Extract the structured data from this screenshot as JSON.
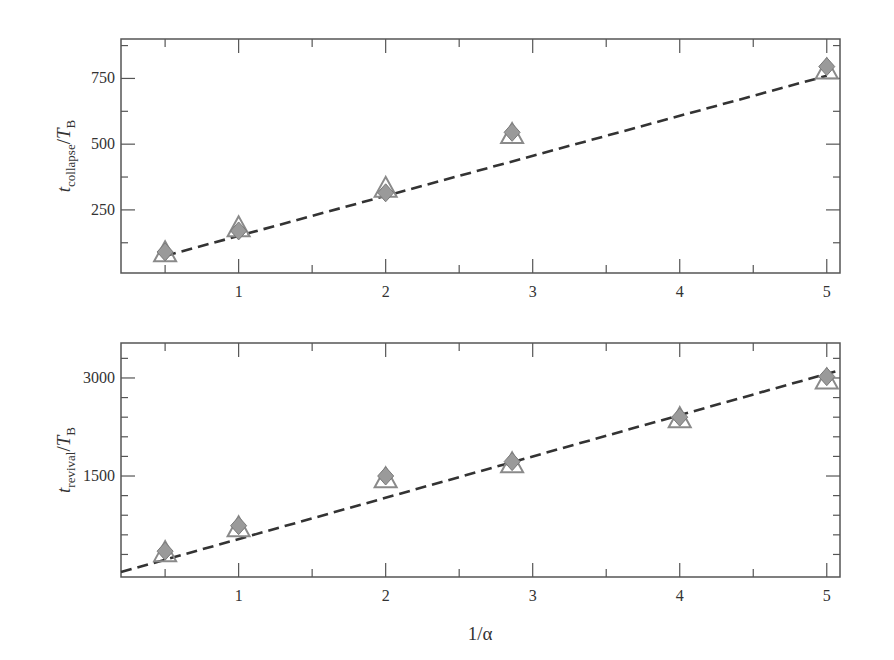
{
  "figure": {
    "xlabel": "1/α",
    "colors": {
      "frame": "#555555",
      "dashed_line": "#333333",
      "triangle_stroke": "#8a8a8a",
      "diamond_fill": "#9a9a9a",
      "diamond_stroke": "#7a7a7a"
    }
  },
  "chart_data": [
    {
      "type": "scatter",
      "title": "",
      "xlabel": "",
      "ylabel": "t_collapse/T_B",
      "ylabel_main": "t",
      "ylabel_sub": "collapse",
      "ylabel_den": "/T",
      "ylabel_den_sub": "B",
      "xlim": [
        0.2,
        5.09
      ],
      "ylim": [
        10,
        900
      ],
      "x_ticks": [
        1,
        2,
        3,
        4,
        5
      ],
      "x_tick_labels": [
        "1",
        "2",
        "3",
        "4",
        "5"
      ],
      "x_minor_ticks": [
        0.5,
        1.5,
        2.5,
        3.5,
        4.5
      ],
      "y_ticks": [
        250,
        500,
        750
      ],
      "y_tick_labels": [
        "250",
        "500",
        "750"
      ],
      "y_minor_ticks": [
        125,
        375,
        625,
        875
      ],
      "grid": false,
      "series": [
        {
          "name": "triangles",
          "marker": "open-triangle",
          "x": [
            0.5,
            1,
            2,
            2.86,
            5
          ],
          "y": [
            85,
            180,
            330,
            535,
            780
          ]
        },
        {
          "name": "diamonds",
          "marker": "filled-diamond",
          "x": [
            0.5,
            1,
            2,
            2.86,
            5
          ],
          "y": [
            90,
            170,
            315,
            545,
            795
          ]
        },
        {
          "name": "fit",
          "marker": "dashed-line",
          "x": [
            0.5,
            5
          ],
          "y": [
            75,
            760
          ]
        }
      ]
    },
    {
      "type": "scatter",
      "title": "",
      "xlabel": "1/α",
      "ylabel": "t_revival/T_B",
      "ylabel_main": "t",
      "ylabel_sub": "revival",
      "ylabel_den": "/T",
      "ylabel_den_sub": "B",
      "xlim": [
        0.2,
        5.09
      ],
      "ylim": [
        -45,
        3535
      ],
      "x_ticks": [
        1,
        2,
        3,
        4,
        5
      ],
      "x_tick_labels": [
        "1",
        "2",
        "3",
        "4",
        "5"
      ],
      "x_minor_ticks": [
        0.5,
        1.5,
        2.5,
        3.5,
        4.5
      ],
      "y_ticks": [
        1500,
        3000
      ],
      "y_tick_labels": [
        "1500",
        "3000"
      ],
      "y_minor_ticks": [
        300,
        600,
        900,
        1200,
        1800,
        2100,
        2400,
        2700,
        3300
      ],
      "grid": false,
      "series": [
        {
          "name": "triangles",
          "marker": "open-triangle",
          "x": [
            0.5,
            1,
            2,
            2.86,
            4,
            5
          ],
          "y": [
            320,
            700,
            1450,
            1680,
            2370,
            2960
          ]
        },
        {
          "name": "diamonds",
          "marker": "filled-diamond",
          "x": [
            0.5,
            1,
            2,
            2.86,
            4,
            5
          ],
          "y": [
            350,
            740,
            1500,
            1720,
            2400,
            3020
          ]
        },
        {
          "name": "fit",
          "marker": "dashed-line",
          "x": [
            0.2,
            5.09
          ],
          "y": [
            30,
            3120
          ]
        }
      ]
    }
  ]
}
